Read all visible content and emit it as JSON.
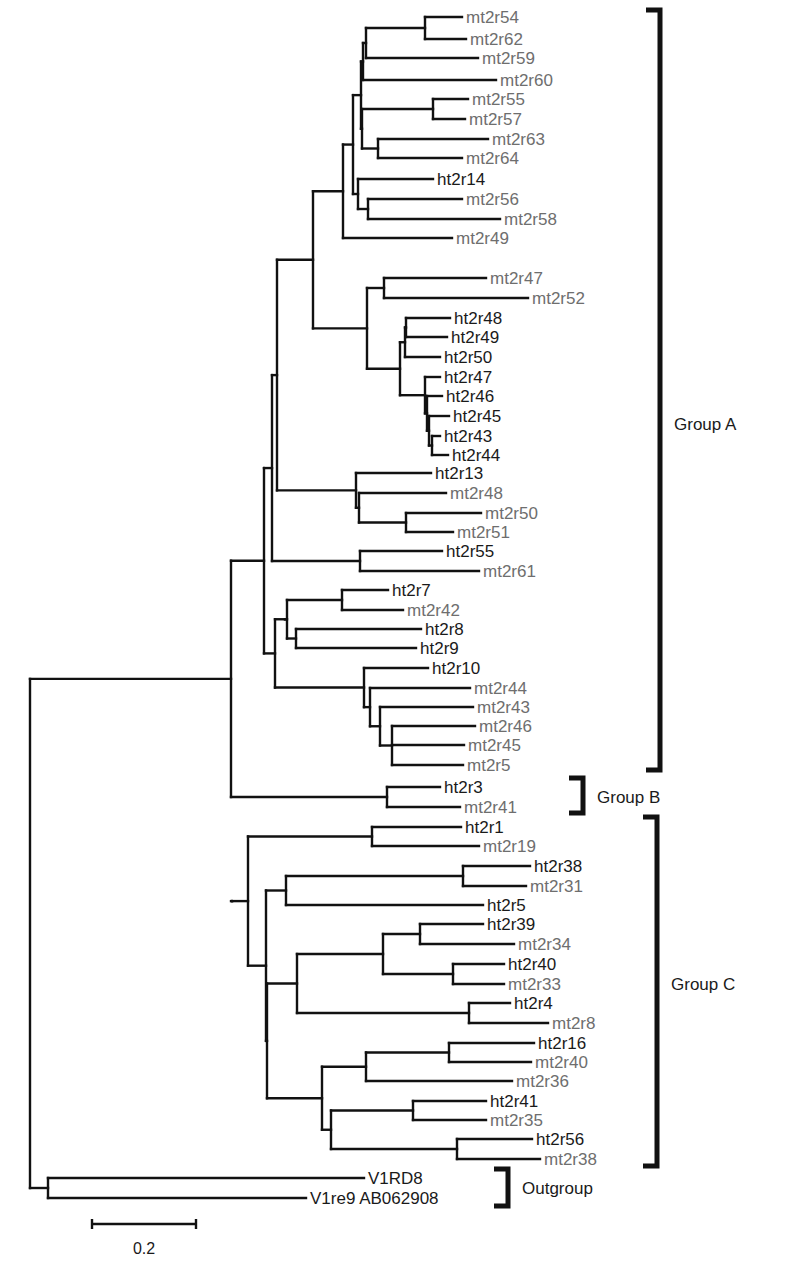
{
  "figure": {
    "type": "phylogenetic-tree",
    "leaf_colors": {
      "mt": "#6e6e6e",
      "ht": "#1a1a1a"
    },
    "line_color": "#111111",
    "leaves": [
      {
        "label": "mt2r54",
        "y": 17,
        "x": 466
      },
      {
        "label": "mt2r62",
        "y": 39,
        "x": 470
      },
      {
        "label": "mt2r59",
        "y": 58,
        "x": 482
      },
      {
        "label": "mt2r60",
        "y": 80,
        "x": 500
      },
      {
        "label": "mt2r55",
        "y": 99,
        "x": 472
      },
      {
        "label": "mt2r57",
        "y": 119,
        "x": 469
      },
      {
        "label": "mt2r63",
        "y": 139,
        "x": 492
      },
      {
        "label": "mt2r64",
        "y": 158,
        "x": 466
      },
      {
        "label": "ht2r14",
        "y": 179,
        "x": 437
      },
      {
        "label": "mt2r56",
        "y": 199,
        "x": 466
      },
      {
        "label": "mt2r58",
        "y": 219,
        "x": 504
      },
      {
        "label": "mt2r49",
        "y": 238,
        "x": 456
      },
      {
        "label": "mt2r47",
        "y": 278,
        "x": 490
      },
      {
        "label": "mt2r52",
        "y": 298,
        "x": 532
      },
      {
        "label": "ht2r48",
        "y": 318,
        "x": 454
      },
      {
        "label": "ht2r49",
        "y": 337,
        "x": 451
      },
      {
        "label": "ht2r50",
        "y": 357,
        "x": 444
      },
      {
        "label": "ht2r47",
        "y": 377,
        "x": 444
      },
      {
        "label": "ht2r46",
        "y": 396,
        "x": 446
      },
      {
        "label": "ht2r45",
        "y": 416,
        "x": 453
      },
      {
        "label": "ht2r43",
        "y": 436,
        "x": 444
      },
      {
        "label": "ht2r44",
        "y": 455,
        "x": 452
      },
      {
        "label": "ht2r13",
        "y": 473,
        "x": 435
      },
      {
        "label": "mt2r48",
        "y": 493,
        "x": 450
      },
      {
        "label": "mt2r50",
        "y": 513,
        "x": 485
      },
      {
        "label": "mt2r51",
        "y": 532,
        "x": 457
      },
      {
        "label": "ht2r55",
        "y": 551,
        "x": 446
      },
      {
        "label": "mt2r61",
        "y": 571,
        "x": 483
      },
      {
        "label": "ht2r7",
        "y": 590,
        "x": 392
      },
      {
        "label": "mt2r42",
        "y": 610,
        "x": 407
      },
      {
        "label": "ht2r8",
        "y": 629,
        "x": 425
      },
      {
        "label": "ht2r9",
        "y": 648,
        "x": 420
      },
      {
        "label": "ht2r10",
        "y": 668,
        "x": 432
      },
      {
        "label": "mt2r44",
        "y": 688,
        "x": 474
      },
      {
        "label": "mt2r43",
        "y": 707,
        "x": 477
      },
      {
        "label": "mt2r46",
        "y": 726,
        "x": 479
      },
      {
        "label": "mt2r45",
        "y": 745,
        "x": 468
      },
      {
        "label": "mt2r5",
        "y": 765,
        "x": 467
      },
      {
        "label": "ht2r3",
        "y": 787,
        "x": 444
      },
      {
        "label": "mt2r41",
        "y": 807,
        "x": 464
      },
      {
        "label": "ht2r1",
        "y": 827,
        "x": 465
      },
      {
        "label": "mt2r19",
        "y": 846,
        "x": 483
      },
      {
        "label": "ht2r38",
        "y": 866,
        "x": 534
      },
      {
        "label": "mt2r31",
        "y": 886,
        "x": 530
      },
      {
        "label": "ht2r5",
        "y": 905,
        "x": 487
      },
      {
        "label": "ht2r39",
        "y": 924,
        "x": 487
      },
      {
        "label": "mt2r34",
        "y": 944,
        "x": 518
      },
      {
        "label": "ht2r40",
        "y": 964,
        "x": 508
      },
      {
        "label": "mt2r33",
        "y": 984,
        "x": 508
      },
      {
        "label": "ht2r4",
        "y": 1003,
        "x": 514
      },
      {
        "label": "mt2r8",
        "y": 1023,
        "x": 552
      },
      {
        "label": "ht2r16",
        "y": 1043,
        "x": 538
      },
      {
        "label": "mt2r40",
        "y": 1062,
        "x": 535
      },
      {
        "label": "mt2r36",
        "y": 1081,
        "x": 516
      },
      {
        "label": "ht2r41",
        "y": 1101,
        "x": 490
      },
      {
        "label": "mt2r35",
        "y": 1120,
        "x": 490
      },
      {
        "label": "ht2r56",
        "y": 1139,
        "x": 536
      },
      {
        "label": "mt2r38",
        "y": 1159,
        "x": 544
      },
      {
        "label": "V1RD8",
        "y": 1178,
        "x": 368
      },
      {
        "label": "V1re9 AB062908",
        "y": 1198,
        "x": 310
      }
    ],
    "groups": [
      {
        "label": "Group A",
        "y_top": 10,
        "y_bottom": 770,
        "x": 660,
        "label_y": 430
      },
      {
        "label": "Group B",
        "y_top": 778,
        "y_bottom": 813,
        "x": 583,
        "label_y": 803
      },
      {
        "label": "Group C",
        "y_top": 817,
        "y_bottom": 1166,
        "x": 657,
        "label_y": 990
      },
      {
        "label": "Outgroup",
        "y_top": 1169,
        "y_bottom": 1206,
        "x": 508,
        "label_y": 1194
      }
    ],
    "scale_bar": {
      "label": "0.2",
      "x1": 92,
      "x2": 196,
      "y": 1224,
      "label_y": 1254
    }
  }
}
